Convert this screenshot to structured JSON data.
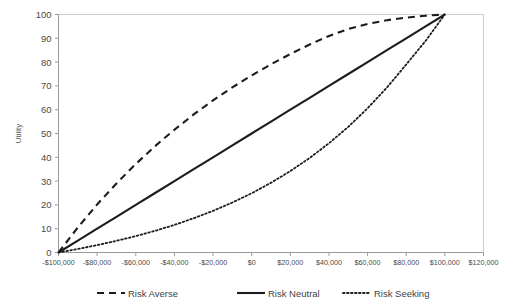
{
  "chart_data": {
    "type": "line",
    "title": "",
    "subtitle": "",
    "xlabel": "",
    "ylabel": "Utility",
    "xlim": [
      -100000,
      120000
    ],
    "ylim": [
      0,
      100
    ],
    "grid": false,
    "legend_position": "bottom",
    "x_tick_labels": [
      "-$100,000",
      "-$80,000",
      "-$60,000",
      "-$40,000",
      "-$20,000",
      "$0",
      "$20,000",
      "$40,000",
      "$60,000",
      "$80,000",
      "$100,000",
      "$120,000"
    ],
    "x_tick_values": [
      -100000,
      -80000,
      -60000,
      -40000,
      -20000,
      0,
      20000,
      40000,
      60000,
      80000,
      100000,
      120000
    ],
    "y_tick_labels": [
      "0",
      "10",
      "20",
      "30",
      "40",
      "50",
      "60",
      "70",
      "80",
      "90",
      "100"
    ],
    "y_tick_values": [
      0,
      10,
      20,
      30,
      40,
      50,
      60,
      70,
      80,
      90,
      100
    ],
    "x": [
      -100000,
      -90000,
      -80000,
      -70000,
      -60000,
      -50000,
      -40000,
      -30000,
      -20000,
      -10000,
      0,
      10000,
      20000,
      30000,
      40000,
      50000,
      60000,
      70000,
      80000,
      90000,
      100000
    ],
    "series": [
      {
        "name": "Risk Averse",
        "style": "dashed",
        "color": "#1c1c1c",
        "values": [
          0,
          10.5,
          20.2,
          29.0,
          37.2,
          44.7,
          51.6,
          58.0,
          63.9,
          69.4,
          74.4,
          79.1,
          83.4,
          87.4,
          91.0,
          93.9,
          96.0,
          97.6,
          98.7,
          99.5,
          100
        ]
      },
      {
        "name": "Risk Neutral",
        "style": "solid",
        "color": "#1c1c1c",
        "values": [
          0,
          5,
          10,
          15,
          20,
          25,
          30,
          35,
          40,
          45,
          50,
          55,
          60,
          65,
          70,
          75,
          80,
          85,
          90,
          95,
          100
        ]
      },
      {
        "name": "Risk Seeking",
        "style": "dotted",
        "color": "#1c1c1c",
        "values": [
          0,
          1.5,
          3.1,
          4.9,
          6.9,
          9.1,
          11.6,
          14.4,
          17.5,
          21.0,
          24.9,
          29.3,
          34.2,
          39.7,
          45.9,
          52.8,
          60.6,
          69.3,
          79.0,
          88.9,
          100
        ]
      }
    ]
  },
  "legend": {
    "items": [
      {
        "label": "Risk Averse"
      },
      {
        "label": "Risk Neutral"
      },
      {
        "label": "Risk Seeking"
      }
    ]
  },
  "axes": {
    "y_axis_title": "Utility"
  }
}
